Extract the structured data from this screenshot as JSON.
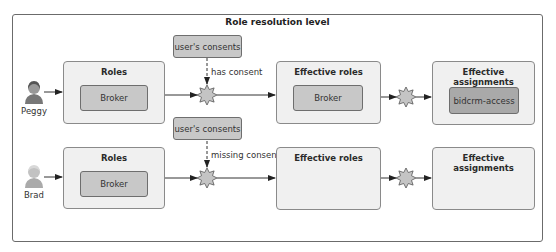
{
  "title": "Role resolution level",
  "colors": {
    "frame_border": "#6b6b6b",
    "box_fill": "#f0f0f0",
    "chip_fill": "#c8c8c8",
    "chip_dark_fill": "#a9a9a9",
    "star_fill": "#c4c4c4"
  },
  "rows": [
    {
      "user": {
        "name": "Peggy",
        "icon": "person-female-icon"
      },
      "roles": {
        "title": "Roles",
        "items": [
          "Broker"
        ]
      },
      "consent": {
        "label": "user's consents",
        "edge_label": "has consent"
      },
      "effective_roles": {
        "title": "Effective roles",
        "items": [
          "Broker"
        ]
      },
      "effective_assignments": {
        "title": "Effective assignments",
        "items": [
          "bidcrm-access"
        ]
      }
    },
    {
      "user": {
        "name": "Brad",
        "icon": "person-male-icon"
      },
      "roles": {
        "title": "Roles",
        "items": [
          "Broker"
        ]
      },
      "consent": {
        "label": "user's consents",
        "edge_label": "missing consent"
      },
      "effective_roles": {
        "title": "Effective roles",
        "items": []
      },
      "effective_assignments": {
        "title": "Effective assignments",
        "items": []
      }
    }
  ]
}
